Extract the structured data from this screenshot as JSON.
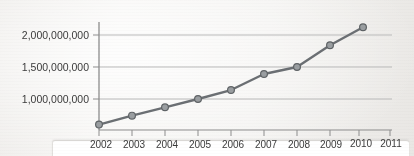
{
  "chart_data": {
    "type": "line",
    "title": "",
    "subtitle": "",
    "xlabel": "",
    "ylabel": "",
    "x": [
      2002,
      2003,
      2004,
      2005,
      2006,
      2007,
      2008,
      2009,
      2010
    ],
    "categories": [
      "2002",
      "2003",
      "2004",
      "2005",
      "2006",
      "2007",
      "2008",
      "2009",
      "2010"
    ],
    "values": [
      600000000,
      740000000,
      870000000,
      1000000000,
      1140000000,
      1390000000,
      1500000000,
      1840000000,
      2120000000
    ],
    "series": [
      {
        "name": "",
        "values": [
          600000000,
          740000000,
          870000000,
          1000000000,
          1140000000,
          1390000000,
          1500000000,
          1840000000,
          2120000000
        ]
      }
    ],
    "xlim": [
      2002,
      2011
    ],
    "ylim": [
      500000000,
      2200000000
    ],
    "xticks": [
      "2002",
      "2003",
      "2004",
      "2005",
      "2006",
      "2007",
      "2008",
      "2009",
      "2010",
      "2011"
    ],
    "yticks": [
      "1,000,000,000",
      "1,500,000,000",
      "2,000,000,000"
    ],
    "ytick_values": [
      1000000000,
      1500000000,
      2000000000
    ],
    "grid": true,
    "grid_axis": "y",
    "legend": false,
    "legend_position": "none",
    "annotations": [],
    "colors": {
      "line": "#6b6f73",
      "marker_fill": "#9a9ea1",
      "marker_stroke": "#5f6366",
      "gridline": "#b9b9b9",
      "axis": "#8d8d8d",
      "text": "#3b3b3b",
      "background": "#f2f1ef"
    },
    "marker": "circle",
    "line_width": 2.4
  },
  "axes": {
    "y_labels": [
      "2,000,000,000",
      "1,500,000,000",
      "1,000,000,000"
    ],
    "x_labels": [
      "2002",
      "2003",
      "2004",
      "2005",
      "2006",
      "2007",
      "2008",
      "2009",
      "2010",
      "2011"
    ]
  }
}
